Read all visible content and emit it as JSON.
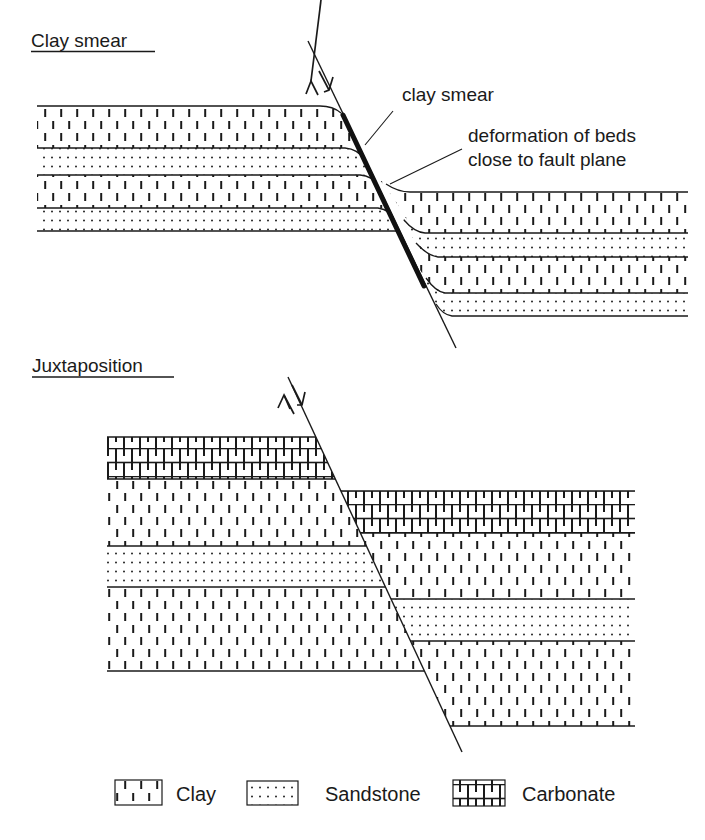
{
  "figure": {
    "panels": [
      {
        "id": "clay-smear",
        "title": "Clay smear",
        "annotations": [
          {
            "text": "clay smear"
          },
          {
            "text_lines": [
              "deformation of beds",
              "close to fault plane"
            ]
          }
        ],
        "fault_symbol": "normal-fault-arrows",
        "hanging_wall_layers_top_to_bottom": [
          "Clay",
          "Sandstone",
          "Clay",
          "Sandstone"
        ],
        "footwall_layers_top_to_bottom": [
          "Clay",
          "Sandstone",
          "Clay",
          "Sandstone"
        ]
      },
      {
        "id": "juxtaposition",
        "title": "Juxtaposition",
        "fault_symbol": "normal-fault-arrows",
        "footwall_layers_top_to_bottom": [
          "Carbonate",
          "Clay",
          "Sandstone",
          "Clay"
        ],
        "hanging_wall_layers_top_to_bottom": [
          "Carbonate",
          "Clay",
          "Sandstone",
          "Clay"
        ]
      }
    ],
    "legend": [
      {
        "label": "Clay",
        "pattern": "clay-dashes"
      },
      {
        "label": "Sandstone",
        "pattern": "sand-dots"
      },
      {
        "label": "Carbonate",
        "pattern": "carbonate-bricks"
      }
    ],
    "colors": {
      "line": "#1a1a1a",
      "background": "#ffffff"
    }
  }
}
